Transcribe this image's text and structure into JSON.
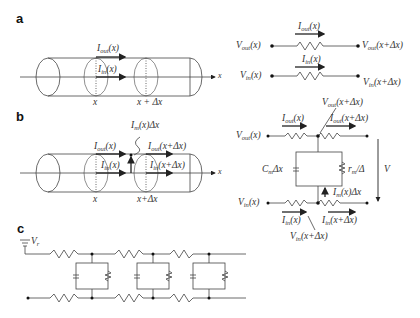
{
  "panels": {
    "a": {
      "label": "a",
      "cylinder": {
        "x_label": "x",
        "x_dx_label": "x + Δx",
        "axis_label": "x",
        "i_out": "I",
        "i_out_sub": "out",
        "i_out_arg": "(x)",
        "i_in": "I",
        "i_in_sub": "in",
        "i_in_arg": "(x)"
      },
      "circuit": {
        "v_out_left": "V",
        "v_out_left_sub": "out",
        "v_out_left_arg": "(x)",
        "v_out_right": "V",
        "v_out_right_sub": "out",
        "v_out_right_arg": "(x+Δx)",
        "i_out": "I",
        "i_out_sub": "out",
        "i_out_arg": "(x)",
        "i_in": "I",
        "i_in_sub": "in",
        "i_in_arg": "(x)",
        "v_in_left": "V",
        "v_in_left_sub": "in",
        "v_in_left_arg": "(x)",
        "v_in_right": "V",
        "v_in_right_sub": "in",
        "v_in_right_arg": "(x+Δx)"
      }
    },
    "b": {
      "label": "b",
      "cylinder": {
        "x_label": "x",
        "x_dx_label": "x+Δx",
        "axis_label": "x",
        "i_m": "I",
        "i_m_sub": "m",
        "i_m_arg": "(x)Δx",
        "i_out": "I",
        "i_out_sub": "out",
        "i_out_arg": "(x)",
        "i_out2": "I",
        "i_out2_sub": "out",
        "i_out2_arg": "(x+Δx)",
        "i_in": "I",
        "i_in_sub": "in",
        "i_in_arg": "(x)",
        "i_in2": "I",
        "i_in2_sub": "in",
        "i_in2_arg": "(x+Δx)"
      },
      "circuit": {
        "v_out_top": "V",
        "v_out_top_sub": "out",
        "v_out_top_arg": "(x+Δx)",
        "i_out": "I",
        "i_out_sub": "out",
        "i_out_arg": "(x)",
        "i_out2": "I",
        "i_out2_sub": "out",
        "i_out2_arg": "(x+Δx)",
        "v_out_left": "V",
        "v_out_left_sub": "out",
        "v_out_left_arg": "(x)",
        "cap": "C",
        "cap_sub": "m",
        "cap_arg": "Δx",
        "res": "r",
        "res_sub": "m",
        "res_arg": "/Δ",
        "v": "V",
        "i_m": "I",
        "i_m_sub": "m",
        "i_m_arg": "(x)Δx",
        "v_in_left": "V",
        "v_in_left_sub": "in",
        "v_in_left_arg": "(x)",
        "i_in": "I",
        "i_in_sub": "in",
        "i_in_arg": "(x)",
        "i_in2": "I",
        "i_in2_sub": "in",
        "i_in2_arg": "(x+Δx)",
        "v_in_bottom": "V",
        "v_in_bottom_sub": "in",
        "v_in_bottom_arg": "(x+Δx)"
      }
    },
    "c": {
      "label": "c",
      "ground": "V",
      "ground_sub": "r"
    }
  }
}
